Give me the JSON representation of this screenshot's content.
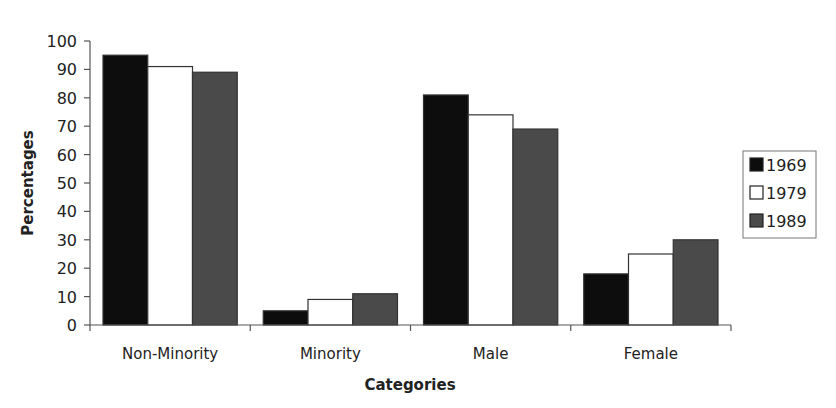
{
  "chart_data": {
    "type": "bar",
    "title": "",
    "xlabel": "Categories",
    "ylabel": "Percentages",
    "ylim": [
      0,
      100
    ],
    "yticks": [
      0,
      10,
      20,
      30,
      40,
      50,
      60,
      70,
      80,
      90,
      100
    ],
    "categories": [
      "Non-Minority",
      "Minority",
      "Male",
      "Female"
    ],
    "series": [
      {
        "name": "1969",
        "color": "#0d0d0d",
        "values": [
          95,
          5,
          81,
          18
        ]
      },
      {
        "name": "1979",
        "color": "#ffffff",
        "values": [
          91,
          9,
          74,
          25
        ]
      },
      {
        "name": "1989",
        "color": "#4a4a4a",
        "values": [
          89,
          11,
          69,
          30
        ]
      }
    ],
    "grid": false,
    "legend_position": "right"
  }
}
